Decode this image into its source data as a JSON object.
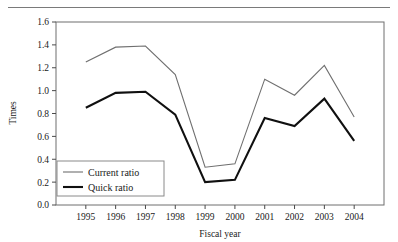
{
  "figure": {
    "clipped_header_text": "",
    "rule_name": "top-horizontal-rule"
  },
  "chart_data": {
    "type": "line",
    "title": "",
    "subtitle": "",
    "xlabel": "Fiscal year",
    "ylabel": "Times",
    "x": [
      "1995",
      "1996",
      "1997",
      "1998",
      "1999",
      "2000",
      "2001",
      "2002",
      "2003",
      "2004"
    ],
    "categories": [
      "1995",
      "1996",
      "1997",
      "1998",
      "1999",
      "2000",
      "2001",
      "2002",
      "2003",
      "2004"
    ],
    "xtick_labels": [
      "1995",
      "1996",
      "1997",
      "1998",
      "1999",
      "2000",
      "2001",
      "2002",
      "2003",
      "2004"
    ],
    "ytick_labels": [
      "0.0",
      "0.2",
      "0.4",
      "0.6",
      "0.8",
      "1.0",
      "1.2",
      "1.4",
      "1.6"
    ],
    "yticks": [
      0.0,
      0.2,
      0.4,
      0.6,
      0.8,
      1.0,
      1.2,
      1.4,
      1.6
    ],
    "ylim": [
      0.0,
      1.6
    ],
    "grid": false,
    "legend_position": "inside lower-left",
    "series": [
      {
        "name": "Current ratio",
        "color": "#6f6f6f",
        "line_width": "thin",
        "values": [
          1.25,
          1.38,
          1.39,
          1.14,
          0.33,
          0.36,
          1.1,
          0.96,
          1.22,
          0.77
        ]
      },
      {
        "name": "Quick ratio",
        "color": "#101010",
        "line_width": "thick",
        "values": [
          0.85,
          0.98,
          0.99,
          0.79,
          0.2,
          0.22,
          0.76,
          0.69,
          0.93,
          0.56
        ]
      }
    ]
  }
}
